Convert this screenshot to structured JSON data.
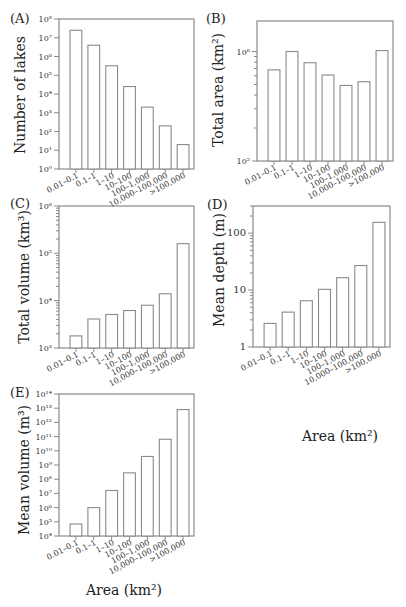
{
  "figure": {
    "categories": [
      "0.01–0.1",
      "0.1–1",
      "1–10",
      "10–100",
      "100–1,000",
      "10,000–100,000",
      ">100,000"
    ],
    "xlabel": "Area (km²)"
  },
  "chart_data": [
    {
      "panel": "(A)",
      "type": "bar",
      "title": "",
      "xlabel": "",
      "ylabel": "Number of lakes",
      "yscale": "log",
      "ylim": [
        1,
        100000000
      ],
      "yticks": [
        "10⁰",
        "10¹",
        "10²",
        "10³",
        "10⁴",
        "10⁵",
        "10⁶",
        "10⁷",
        "10⁸"
      ],
      "categories": [
        "0.01–0.1",
        "0.1–1",
        "1–10",
        "10–100",
        "100–1,000",
        "10,000–100,000",
        ">100,000"
      ],
      "values": [
        25000000,
        4000000,
        320000,
        25000,
        2000,
        200,
        20
      ],
      "grid": false
    },
    {
      "panel": "(B)",
      "type": "bar",
      "title": "",
      "xlabel": "",
      "ylabel": "Total area (km²)",
      "yscale": "log",
      "ylim": [
        100000,
        1900000
      ],
      "yticks": [
        "10⁵",
        "10⁶"
      ],
      "categories": [
        "0.01–0.1",
        "0.1–1",
        "1–10",
        "10–100",
        "100–1,000",
        "10,000–100,000",
        ">100,000"
      ],
      "values": [
        680000,
        1000000,
        790000,
        610000,
        490000,
        530000,
        1020000
      ],
      "grid": false
    },
    {
      "panel": "(C)",
      "type": "bar",
      "title": "",
      "xlabel": "",
      "ylabel": "Total volume (km³)",
      "yscale": "log",
      "ylim": [
        1000,
        1000000
      ],
      "yticks": [
        "10³",
        "10⁴",
        "10⁵",
        "10⁶"
      ],
      "categories": [
        "0.01–0.1",
        "0.1–1",
        "1–10",
        "10–100",
        "100–1,000",
        "10,000–100,000",
        ">100,000"
      ],
      "values": [
        1800,
        4100,
        5100,
        6200,
        8000,
        14000,
        160000
      ],
      "grid": false
    },
    {
      "panel": "(D)",
      "type": "bar",
      "title": "",
      "xlabel": "Area (km²)",
      "ylabel": "Mean depth (m)",
      "yscale": "log",
      "ylim": [
        1,
        300
      ],
      "yticks": [
        "1",
        "10",
        "100"
      ],
      "categories": [
        "0.01–0.1",
        "0.1–1",
        "1–10",
        "10–100",
        "100–1,000",
        "10,000–100,000",
        ">100,000"
      ],
      "values": [
        2.6,
        4.1,
        6.5,
        10.3,
        16.5,
        27,
        155
      ],
      "grid": false
    },
    {
      "panel": "(E)",
      "type": "bar",
      "title": "",
      "xlabel": "Area (km²)",
      "ylabel": "Mean volume (m³)",
      "yscale": "log",
      "ylim": [
        10000,
        100000000000000
      ],
      "yticks": [
        "10⁴",
        "10⁵",
        "10⁶",
        "10⁷",
        "10⁸",
        "10⁹",
        "10¹⁰",
        "10¹¹",
        "10¹²",
        "10¹³",
        "10¹⁴"
      ],
      "categories": [
        "0.01–0.1",
        "0.1–1",
        "1–10",
        "10–100",
        "100–1,000",
        "10,000–100,000",
        ">100,000"
      ],
      "values": [
        70000,
        1000000,
        16000000,
        280000000,
        4000000000,
        65000000000,
        8000000000000
      ],
      "grid": false
    }
  ],
  "panels": {
    "a": {
      "label": "(A)",
      "ylabel": "Number of lakes"
    },
    "b": {
      "label": "(B)",
      "ylabel": "Total area (km²)"
    },
    "c": {
      "label": "(C)",
      "ylabel": "Total volume (km³)"
    },
    "d": {
      "label": "(D)",
      "ylabel": "Mean depth (m)",
      "xlabel": "Area (km²)"
    },
    "e": {
      "label": "(E)",
      "ylabel": "Mean volume (m³)",
      "xlabel": "Area (km²)"
    }
  }
}
